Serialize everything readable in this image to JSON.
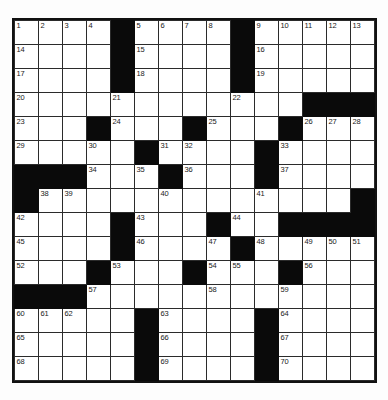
{
  "puzzle": {
    "title": "Crossword Grid",
    "rows": 15,
    "cols": 15,
    "cell_size_px": 23,
    "colors": {
      "block": "#0a0a0a",
      "open": "#ffffff",
      "border": "#2b2b2b",
      "frame": "#111111",
      "number_text": "#1a1a1a",
      "page_background": "#fdfdfd"
    },
    "layout_legend": {
      "1": "open (white) cell",
      "0": "blocked (black) cell"
    },
    "grid": [
      [
        1,
        1,
        1,
        1,
        0,
        1,
        1,
        1,
        1,
        0,
        1,
        1,
        1,
        1,
        1
      ],
      [
        1,
        1,
        1,
        1,
        0,
        1,
        1,
        1,
        1,
        0,
        1,
        1,
        1,
        1,
        1
      ],
      [
        1,
        1,
        1,
        1,
        0,
        1,
        1,
        1,
        1,
        0,
        1,
        1,
        1,
        1,
        1
      ],
      [
        1,
        1,
        1,
        1,
        1,
        1,
        1,
        1,
        1,
        1,
        1,
        1,
        0,
        0,
        0
      ],
      [
        1,
        1,
        1,
        0,
        1,
        1,
        1,
        0,
        1,
        1,
        1,
        0,
        1,
        1,
        1
      ],
      [
        1,
        1,
        1,
        1,
        1,
        0,
        1,
        1,
        1,
        1,
        0,
        1,
        1,
        1,
        1
      ],
      [
        0,
        0,
        0,
        1,
        1,
        1,
        0,
        1,
        1,
        1,
        0,
        1,
        1,
        1,
        1
      ],
      [
        0,
        1,
        1,
        1,
        1,
        1,
        1,
        1,
        1,
        1,
        1,
        1,
        1,
        1,
        0
      ],
      [
        1,
        1,
        1,
        1,
        0,
        1,
        1,
        1,
        0,
        1,
        1,
        0,
        0,
        0,
        0
      ],
      [
        1,
        1,
        1,
        1,
        0,
        1,
        1,
        1,
        1,
        0,
        1,
        1,
        1,
        1,
        1
      ],
      [
        1,
        1,
        1,
        0,
        1,
        1,
        1,
        0,
        1,
        1,
        1,
        0,
        1,
        1,
        1
      ],
      [
        0,
        0,
        0,
        1,
        1,
        1,
        1,
        1,
        1,
        1,
        1,
        1,
        1,
        1,
        1
      ],
      [
        1,
        1,
        1,
        1,
        1,
        0,
        1,
        1,
        1,
        1,
        0,
        1,
        1,
        1,
        1
      ],
      [
        1,
        1,
        1,
        1,
        1,
        0,
        1,
        1,
        1,
        1,
        0,
        1,
        1,
        1,
        1
      ],
      [
        1,
        1,
        1,
        1,
        1,
        0,
        1,
        1,
        1,
        1,
        0,
        1,
        1,
        1,
        1
      ]
    ],
    "numbers": [
      {
        "row": 0,
        "col": 0,
        "n": "1"
      },
      {
        "row": 0,
        "col": 1,
        "n": "2"
      },
      {
        "row": 0,
        "col": 2,
        "n": "3"
      },
      {
        "row": 0,
        "col": 3,
        "n": "4"
      },
      {
        "row": 0,
        "col": 5,
        "n": "5"
      },
      {
        "row": 0,
        "col": 6,
        "n": "6"
      },
      {
        "row": 0,
        "col": 7,
        "n": "7"
      },
      {
        "row": 0,
        "col": 8,
        "n": "8"
      },
      {
        "row": 0,
        "col": 10,
        "n": "9"
      },
      {
        "row": 0,
        "col": 11,
        "n": "10"
      },
      {
        "row": 0,
        "col": 12,
        "n": "11"
      },
      {
        "row": 0,
        "col": 13,
        "n": "12"
      },
      {
        "row": 0,
        "col": 14,
        "n": "13"
      },
      {
        "row": 1,
        "col": 0,
        "n": "14"
      },
      {
        "row": 1,
        "col": 5,
        "n": "15"
      },
      {
        "row": 1,
        "col": 10,
        "n": "16"
      },
      {
        "row": 2,
        "col": 0,
        "n": "17"
      },
      {
        "row": 2,
        "col": 5,
        "n": "18"
      },
      {
        "row": 2,
        "col": 10,
        "n": "19"
      },
      {
        "row": 3,
        "col": 0,
        "n": "20"
      },
      {
        "row": 3,
        "col": 4,
        "n": "21"
      },
      {
        "row": 3,
        "col": 9,
        "n": "22"
      },
      {
        "row": 4,
        "col": 0,
        "n": "23"
      },
      {
        "row": 4,
        "col": 4,
        "n": "24"
      },
      {
        "row": 4,
        "col": 8,
        "n": "25"
      },
      {
        "row": 4,
        "col": 12,
        "n": "26"
      },
      {
        "row": 4,
        "col": 13,
        "n": "27"
      },
      {
        "row": 4,
        "col": 14,
        "n": "28"
      },
      {
        "row": 5,
        "col": 0,
        "n": "29"
      },
      {
        "row": 5,
        "col": 3,
        "n": "30"
      },
      {
        "row": 5,
        "col": 6,
        "n": "31"
      },
      {
        "row": 5,
        "col": 7,
        "n": "32"
      },
      {
        "row": 5,
        "col": 11,
        "n": "33"
      },
      {
        "row": 6,
        "col": 3,
        "n": "34"
      },
      {
        "row": 6,
        "col": 5,
        "n": "35"
      },
      {
        "row": 6,
        "col": 7,
        "n": "36"
      },
      {
        "row": 6,
        "col": 11,
        "n": "37"
      },
      {
        "row": 7,
        "col": 1,
        "n": "38"
      },
      {
        "row": 7,
        "col": 2,
        "n": "39"
      },
      {
        "row": 7,
        "col": 6,
        "n": "40"
      },
      {
        "row": 7,
        "col": 10,
        "n": "41"
      },
      {
        "row": 8,
        "col": 0,
        "n": "42"
      },
      {
        "row": 8,
        "col": 5,
        "n": "43"
      },
      {
        "row": 8,
        "col": 9,
        "n": "44"
      },
      {
        "row": 9,
        "col": 0,
        "n": "45"
      },
      {
        "row": 9,
        "col": 5,
        "n": "46"
      },
      {
        "row": 9,
        "col": 8,
        "n": "47"
      },
      {
        "row": 9,
        "col": 10,
        "n": "48"
      },
      {
        "row": 9,
        "col": 12,
        "n": "49"
      },
      {
        "row": 9,
        "col": 13,
        "n": "50"
      },
      {
        "row": 9,
        "col": 14,
        "n": "51"
      },
      {
        "row": 10,
        "col": 0,
        "n": "52"
      },
      {
        "row": 10,
        "col": 4,
        "n": "53"
      },
      {
        "row": 10,
        "col": 8,
        "n": "54"
      },
      {
        "row": 10,
        "col": 9,
        "n": "55"
      },
      {
        "row": 10,
        "col": 12,
        "n": "56"
      },
      {
        "row": 11,
        "col": 3,
        "n": "57"
      },
      {
        "row": 11,
        "col": 8,
        "n": "58"
      },
      {
        "row": 11,
        "col": 11,
        "n": "59"
      },
      {
        "row": 12,
        "col": 0,
        "n": "60"
      },
      {
        "row": 12,
        "col": 1,
        "n": "61"
      },
      {
        "row": 12,
        "col": 2,
        "n": "62"
      },
      {
        "row": 12,
        "col": 6,
        "n": "63"
      },
      {
        "row": 12,
        "col": 11,
        "n": "64"
      },
      {
        "row": 13,
        "col": 0,
        "n": "65"
      },
      {
        "row": 13,
        "col": 6,
        "n": "66"
      },
      {
        "row": 13,
        "col": 11,
        "n": "67"
      },
      {
        "row": 14,
        "col": 0,
        "n": "68"
      },
      {
        "row": 14,
        "col": 6,
        "n": "69"
      },
      {
        "row": 14,
        "col": 11,
        "n": "70"
      }
    ]
  }
}
